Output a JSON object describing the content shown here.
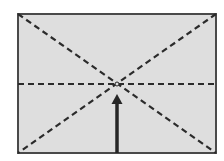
{
  "diagram": {
    "title": "",
    "canvas": {
      "width": 224,
      "height": 161,
      "background": "#ffffff"
    },
    "frame": {
      "x": 18,
      "y": 14,
      "width": 198,
      "height": 139,
      "fill": "#dedede",
      "stroke": "#4a4a4a",
      "stroke_width": 2
    },
    "guides": [
      {
        "id": "diagonal-top-left-to-bottom-right",
        "x1": 18,
        "y1": 14,
        "x2": 216,
        "y2": 153,
        "style": "dashed"
      },
      {
        "id": "diagonal-top-right-to-bottom-left",
        "x1": 216,
        "y1": 14,
        "x2": 18,
        "y2": 153,
        "style": "dashed"
      },
      {
        "id": "horizontal-center-line",
        "x1": 18,
        "y1": 84,
        "x2": 216,
        "y2": 84,
        "style": "dashed"
      }
    ],
    "guide_style": {
      "stroke": "#2b2b2b",
      "stroke_width": 2.2,
      "dash": "6 4"
    },
    "center_point": {
      "x": 117,
      "y": 84,
      "r": 2
    },
    "arrow": {
      "direction": "up",
      "x": 117,
      "y_start": 153,
      "y_tip": 94,
      "shaft_width": 3.5,
      "head_width": 11,
      "head_length": 10,
      "color": "#262626"
    },
    "labels": []
  }
}
